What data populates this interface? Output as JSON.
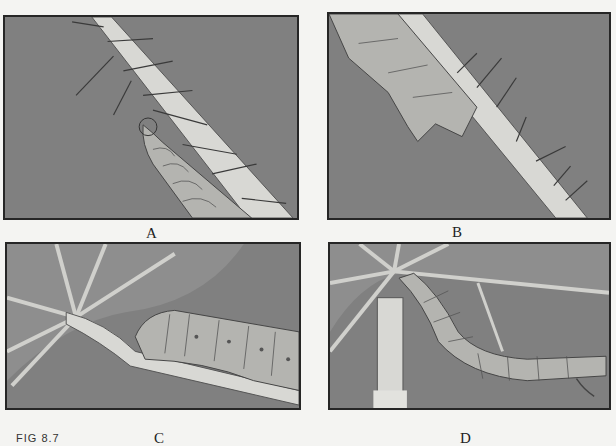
{
  "figure": {
    "label": "FIG 8.7",
    "panels": [
      {
        "id": "A",
        "caption": "A",
        "description": "caterpillar climbing hairy leaf petiole"
      },
      {
        "id": "B",
        "caption": "B",
        "description": "caterpillar head close-up on spiny petiole"
      },
      {
        "id": "C",
        "caption": "C",
        "description": "caterpillar feeding at leaf base under veins"
      },
      {
        "id": "D",
        "caption": "D",
        "description": "caterpillar curled beneath leaf beside chewed petiole"
      }
    ]
  },
  "colors": {
    "panel_bg": "#808080",
    "petiole": "#d8d8d4",
    "caterpillar": "#b4b4b0",
    "border": "#262626",
    "page": "#f4f4f2"
  }
}
